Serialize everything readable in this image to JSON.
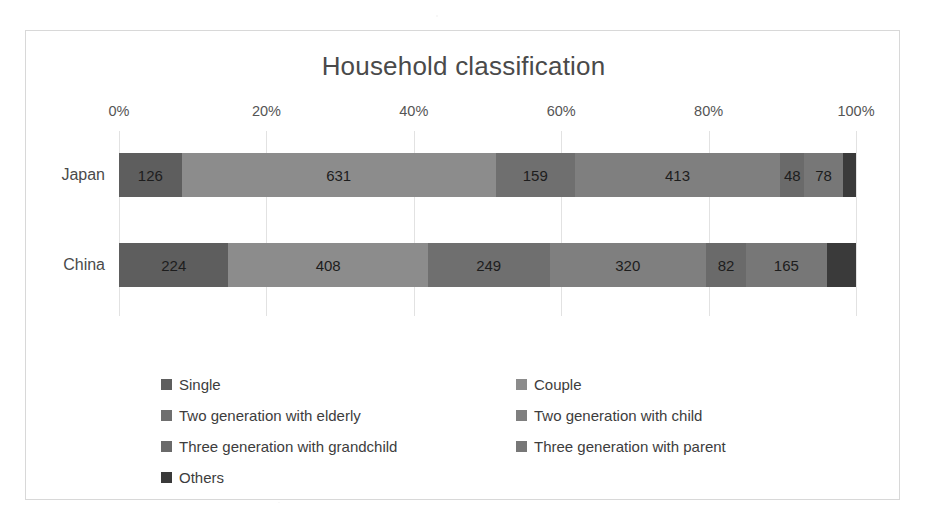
{
  "chart_data": {
    "type": "bar",
    "orientation": "horizontal",
    "stacked": true,
    "normalized": true,
    "title": "Household classification",
    "xlabel": "",
    "ylabel": "",
    "xlim": [
      0,
      100
    ],
    "xtick_labels": [
      "0%",
      "20%",
      "40%",
      "60%",
      "80%",
      "100%"
    ],
    "xtick_values": [
      0,
      20,
      40,
      60,
      80,
      100
    ],
    "grid": true,
    "legend_position": "bottom",
    "categories": [
      "Japan",
      "China"
    ],
    "series": [
      {
        "name": "Single",
        "color": "#5e5e5e",
        "values": [
          126,
          224
        ]
      },
      {
        "name": "Couple",
        "color": "#8c8c8c",
        "values": [
          631,
          408
        ]
      },
      {
        "name": "Two generation with elderly",
        "color": "#6f6f6f",
        "values": [
          159,
          249
        ]
      },
      {
        "name": "Two generation with child",
        "color": "#7f7f7f",
        "values": [
          413,
          320
        ]
      },
      {
        "name": "Three generation with grandchild",
        "color": "#6a6a6a",
        "values": [
          48,
          82
        ]
      },
      {
        "name": "Three generation with parent",
        "color": "#777777",
        "values": [
          78,
          165
        ]
      },
      {
        "name": "Others",
        "color": "#3a3a3a",
        "values": [
          26,
          60
        ]
      }
    ],
    "bar_labels": {
      "Japan": [
        "126",
        "631",
        "159",
        "413",
        "48",
        "78",
        ""
      ],
      "China": [
        "224",
        "408",
        "249",
        "320",
        "82",
        "165",
        ""
      ]
    }
  },
  "legend": {
    "rows": [
      [
        "Single",
        "Couple"
      ],
      [
        "Two generation with elderly",
        "Two generation with child"
      ],
      [
        "Three generation with grandchild",
        "Three generation with parent"
      ],
      [
        "Others"
      ]
    ]
  }
}
